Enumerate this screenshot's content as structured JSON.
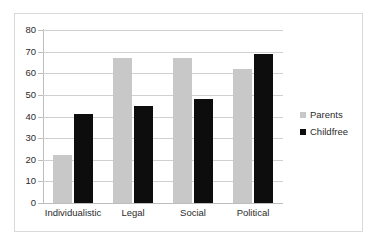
{
  "chart_data": {
    "type": "bar",
    "title": "",
    "subtitle": "",
    "xlabel": "",
    "ylabel": "",
    "categories": [
      "Individualistic",
      "Legal",
      "Social",
      "Political"
    ],
    "series": [
      {
        "name": "Parents",
        "color": "#c8c8c8",
        "values": [
          22,
          67,
          67,
          62
        ]
      },
      {
        "name": "Childfree",
        "color": "#0d0d0d",
        "values": [
          41,
          45,
          48,
          69
        ]
      }
    ],
    "ylim": [
      0,
      80
    ],
    "ytick_step": 10,
    "yticks": [
      0,
      10,
      20,
      30,
      40,
      50,
      60,
      70,
      80
    ],
    "ytick_labels": [
      "0",
      "10",
      "20",
      "30",
      "40",
      "50",
      "60",
      "70",
      "80"
    ],
    "grid": {
      "horizontal": true,
      "vertical": false,
      "color": "#d0d0d0"
    },
    "legend": {
      "position": "right",
      "entries": [
        {
          "label": "Parents",
          "marker": "square",
          "color": "#c8c8c8"
        },
        {
          "label": "Childfree",
          "marker": "square",
          "color": "#0d0d0d"
        }
      ]
    },
    "frame": {
      "border_color": "#d9d9d9",
      "background": "#ffffff"
    },
    "axis_line_color": "#bdbdbd"
  }
}
